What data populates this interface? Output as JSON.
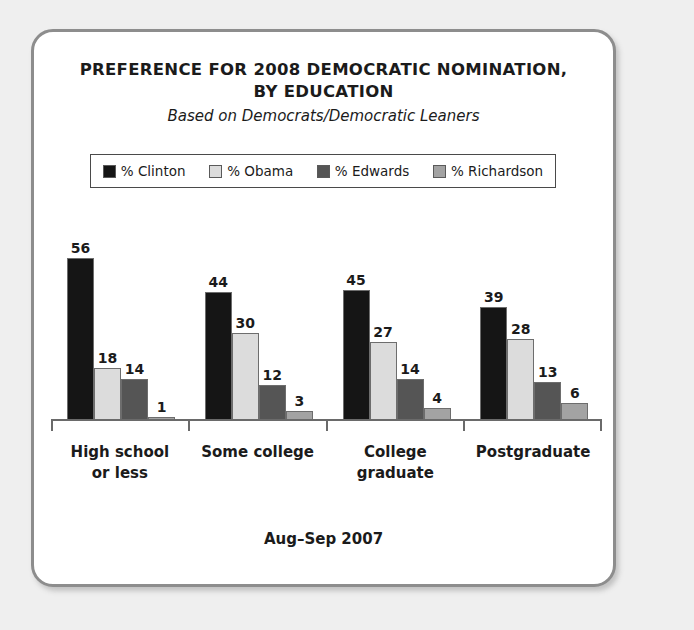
{
  "card": {
    "border_color": "#8d8d8d",
    "background": "#ffffff",
    "page_background": "#efefef"
  },
  "title": {
    "line1": "PREFERENCE FOR 2008 DEMOCRATIC NOMINATION,",
    "line2": "BY EDUCATION",
    "subtitle": "Based on Democrats/Democratic Leaners"
  },
  "footer": {
    "text": "Aug–Sep 2007"
  },
  "legend": {
    "items": [
      {
        "label": "% Clinton",
        "color": "#151515"
      },
      {
        "label": "% Obama",
        "color": "#dcdcdc"
      },
      {
        "label": "% Edwards",
        "color": "#555555"
      },
      {
        "label": "% Richardson",
        "color": "#a3a3a3"
      }
    ]
  },
  "chart_data": {
    "type": "bar",
    "title": "PREFERENCE FOR 2008 DEMOCRATIC NOMINATION, BY EDUCATION",
    "subtitle": "Based on Democrats/Democratic Leaners",
    "annotation": "Aug–Sep 2007",
    "xlabel": "",
    "ylabel": "",
    "ylim": [
      0,
      60
    ],
    "grid": false,
    "legend_position": "top",
    "categories": [
      "High school or less",
      "Some college",
      "College graduate",
      "Postgraduate"
    ],
    "category_lines": [
      [
        "High school",
        "or less"
      ],
      [
        "Some college"
      ],
      [
        "College",
        "graduate"
      ],
      [
        "Postgraduate"
      ]
    ],
    "series": [
      {
        "name": "% Clinton",
        "color": "#151515",
        "values": [
          56,
          44,
          45,
          39
        ]
      },
      {
        "name": "% Obama",
        "color": "#dcdcdc",
        "values": [
          18,
          30,
          27,
          28
        ]
      },
      {
        "name": "% Edwards",
        "color": "#555555",
        "values": [
          14,
          12,
          14,
          13
        ]
      },
      {
        "name": "% Richardson",
        "color": "#a3a3a3",
        "values": [
          1,
          3,
          4,
          6
        ]
      }
    ]
  }
}
